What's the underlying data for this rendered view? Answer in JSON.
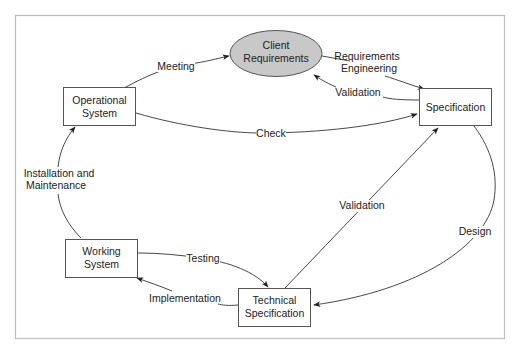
{
  "diagram": {
    "type": "cycle-flow",
    "colors": {
      "ellipse_fill": "#c8c8c8",
      "stroke": "#333333",
      "frame": "#bdbdbd",
      "background": "#ffffff"
    },
    "nodes": {
      "client_requirements": {
        "line1": "Client",
        "line2": "Requirements",
        "shape": "ellipse"
      },
      "specification": {
        "line1": "Specification",
        "shape": "rectangle"
      },
      "technical_specification": {
        "line1": "Technical",
        "line2": "Specification",
        "shape": "rectangle"
      },
      "working_system": {
        "line1": "Working",
        "line2": "System",
        "shape": "rectangle"
      },
      "operational_system": {
        "line1": "Operational",
        "line2": "System",
        "shape": "rectangle"
      }
    },
    "edges": {
      "meeting": {
        "from": "Operational System",
        "to": "Client Requirements",
        "label": "Meeting"
      },
      "requirements_engineering": {
        "from": "Client Requirements",
        "to": "Specification",
        "line1": "Requirements",
        "line2": "Engineering"
      },
      "validation_spec": {
        "from": "Specification",
        "to": "Client Requirements",
        "label": "Validation"
      },
      "check": {
        "from": "Operational System",
        "to": "Specification",
        "label": "Check"
      },
      "validation_tech": {
        "from": "Technical Specification",
        "to": "Specification",
        "label": "Validation"
      },
      "design": {
        "from": "Specification",
        "to": "Technical Specification",
        "label": "Design"
      },
      "testing": {
        "from": "Working System",
        "to": "Technical Specification",
        "label": "Testing"
      },
      "implementation": {
        "from": "Technical Specification",
        "to": "Working System",
        "label": "Implementation"
      },
      "installation": {
        "from": "Working System",
        "to": "Operational System",
        "line1": "Installation and",
        "line2": "Maintenance"
      }
    }
  }
}
